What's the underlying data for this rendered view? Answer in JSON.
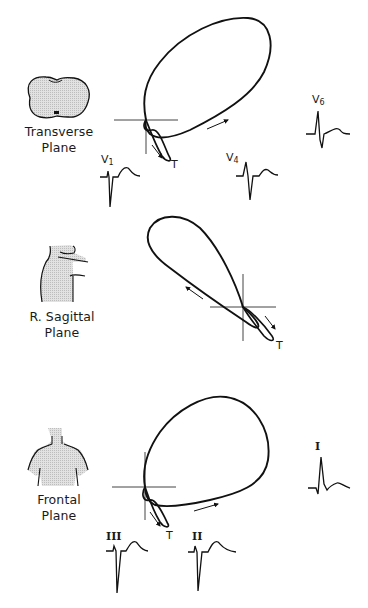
{
  "figure": {
    "panels": [
      {
        "id": "transverse",
        "plane_label_line1": "Transverse",
        "plane_label_line2": "Plane",
        "t_label": "T",
        "leads": [
          {
            "name": "V",
            "sub": "1"
          },
          {
            "name": "V",
            "sub": "4"
          },
          {
            "name": "V",
            "sub": "6"
          }
        ]
      },
      {
        "id": "sagittal",
        "plane_label_line1": "R. Sagittal",
        "plane_label_line2": "Plane",
        "t_label": "T",
        "leads": []
      },
      {
        "id": "frontal",
        "plane_label_line1": "Frontal",
        "plane_label_line2": "Plane",
        "t_label": "T",
        "leads": [
          {
            "name": "III"
          },
          {
            "name": "II"
          },
          {
            "name": "I"
          }
        ]
      }
    ],
    "colors": {
      "stroke": "#111111",
      "body_fill": "#d9d9d9",
      "axis": "#444444"
    }
  }
}
